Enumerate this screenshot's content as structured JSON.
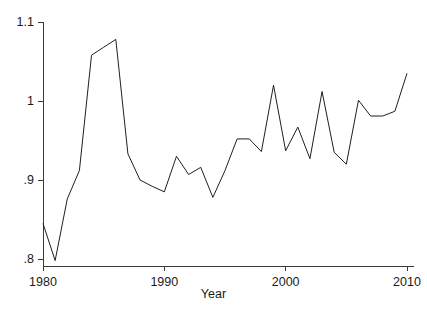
{
  "chart_data": {
    "type": "line",
    "title": "",
    "subtitle": "",
    "xlabel": "Year",
    "ylabel": "",
    "xlim": [
      1979.4,
      2010.6
    ],
    "ylim": [
      0.788,
      1.104
    ],
    "grid": false,
    "legend": null,
    "legend_position": "none",
    "line_color": "#1f1f1f",
    "line_width": 1.0,
    "background_color": "#ffffff",
    "markers": false,
    "x": [
      1980,
      1981,
      1982,
      1983,
      1984,
      1985,
      1986,
      1987,
      1988,
      1989,
      1990,
      1991,
      1992,
      1993,
      1994,
      1995,
      1996,
      1997,
      1998,
      1999,
      2000,
      2001,
      2002,
      2003,
      2004,
      2005,
      2006,
      2007,
      2008,
      2009,
      2010
    ],
    "values": [
      0.845,
      0.798,
      0.876,
      0.912,
      1.058,
      1.068,
      1.078,
      0.933,
      0.9,
      0.892,
      0.885,
      0.93,
      0.907,
      0.916,
      0.878,
      0.912,
      0.952,
      0.952,
      0.936,
      1.02,
      0.937,
      0.967,
      0.927,
      1.012,
      0.935,
      0.92,
      1.001,
      0.981,
      0.981,
      0.987,
      1.035
    ],
    "series": [
      {
        "name": "series-1",
        "values": [
          0.845,
          0.798,
          0.876,
          0.912,
          1.058,
          1.068,
          1.078,
          0.933,
          0.9,
          0.892,
          0.885,
          0.93,
          0.907,
          0.916,
          0.878,
          0.912,
          0.952,
          0.952,
          0.936,
          1.02,
          0.937,
          0.967,
          0.927,
          1.012,
          0.935,
          0.92,
          1.001,
          0.981,
          0.981,
          0.987,
          1.035
        ]
      }
    ],
    "y_ticks": [
      {
        "value": 0.8,
        "label": ".8"
      },
      {
        "value": 0.9,
        "label": ".9"
      },
      {
        "value": 1.0,
        "label": "1"
      },
      {
        "value": 1.1,
        "label": "1.1"
      }
    ],
    "x_ticks": [
      {
        "value": 1980,
        "label": "1980"
      },
      {
        "value": 1990,
        "label": "1990"
      },
      {
        "value": 2000,
        "label": "2000"
      },
      {
        "value": 2010,
        "label": "2010"
      }
    ],
    "axis_color": "#3a3a3a"
  }
}
